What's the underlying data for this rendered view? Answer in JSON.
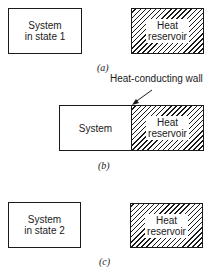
{
  "panels": [
    {
      "id": "a",
      "caption": "(a)",
      "system_label_line1": "System",
      "system_label_line2": "in state 1",
      "reservoir_label_line1": "Heat",
      "reservoir_label_line2": "reservoir",
      "in_contact": false
    },
    {
      "id": "b",
      "caption": "(b)",
      "system_label_line1": "System",
      "reservoir_label_line1": "Heat",
      "reservoir_label_line2": "reservoir",
      "annotation": "Heat-conducting wall",
      "in_contact": true
    },
    {
      "id": "c",
      "caption": "(c)",
      "system_label_line1": "System",
      "system_label_line2": "in state 2",
      "reservoir_label_line1": "Heat",
      "reservoir_label_line2": "reservoir",
      "in_contact": false
    }
  ],
  "colors": {
    "stroke": "#1a1a1a",
    "background": "#ffffff"
  }
}
